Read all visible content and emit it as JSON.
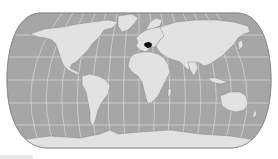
{
  "map": {
    "projection": "Robinson",
    "highlighted_country": "Hungary",
    "colors": {
      "ocean": "#a6a6a6",
      "land": "#e2e2e2",
      "coast": "#7a7a7a",
      "graticule": "#f2f2f2",
      "highlight": "#111111",
      "frame": "#8a8a8a"
    }
  }
}
